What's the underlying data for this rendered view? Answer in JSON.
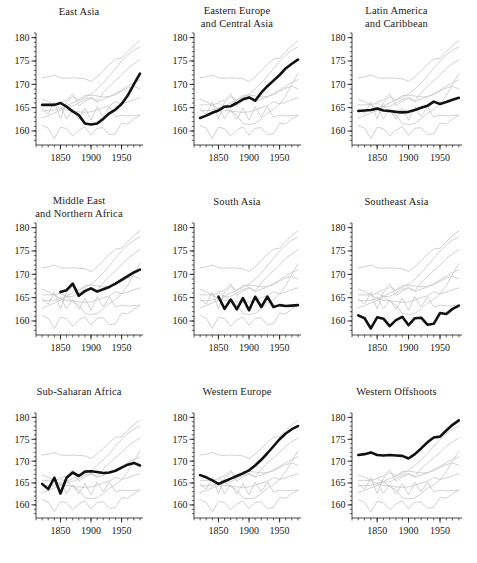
{
  "figure": {
    "type": "small-multiples-line-grid",
    "rows": 3,
    "cols": 3,
    "width": 477,
    "height": 563,
    "background": "#ffffff",
    "highlight_color": "#111111",
    "context_color": "#c9c9c9"
  },
  "chart_data": {
    "type": "line",
    "title": "",
    "subtitle": "",
    "xlabel": "",
    "ylabel": "",
    "xlim": [
      1810,
      1985
    ],
    "ylim": [
      157,
      181
    ],
    "grid": false,
    "legend": "none",
    "x_ticks_major": [
      1850,
      1900,
      1950
    ],
    "x_tick_labels": [
      "1850",
      "1900",
      "1950"
    ],
    "x_ticks_minor_step": 10,
    "y_ticks_major": [
      160,
      165,
      170,
      175,
      180
    ],
    "y_tick_labels": [
      "160",
      "165",
      "170",
      "175",
      "180"
    ],
    "y_ticks_minor_step": 1,
    "x": [
      1820,
      1830,
      1840,
      1850,
      1860,
      1870,
      1880,
      1890,
      1900,
      1910,
      1920,
      1930,
      1940,
      1950,
      1960,
      1970,
      1980
    ],
    "series": [
      {
        "name": "East Asia",
        "panel": 0,
        "values": [
          165.6,
          165.6,
          165.6,
          166.0,
          165.2,
          164.2,
          163.4,
          161.6,
          161.4,
          161.6,
          162.6,
          163.8,
          164.6,
          165.8,
          167.6,
          170.0,
          172.3
        ]
      },
      {
        "name": "Eastern Europe and Central Asia",
        "panel": 1,
        "values": [
          162.8,
          163.3,
          163.9,
          164.4,
          165.2,
          165.3,
          166.0,
          166.8,
          167.2,
          166.5,
          168.2,
          169.6,
          170.8,
          172.0,
          173.4,
          174.4,
          175.3
        ]
      },
      {
        "name": "Latin America and Caribbean",
        "panel": 2,
        "values": [
          164.3,
          164.4,
          164.5,
          164.8,
          164.4,
          164.3,
          164.1,
          164.0,
          164.1,
          164.5,
          165.0,
          165.4,
          166.3,
          165.8,
          166.2,
          166.7,
          167.1
        ]
      },
      {
        "name": "Middle East and Northern Africa",
        "panel": 3,
        "values": [
          null,
          null,
          null,
          166.2,
          166.6,
          168.0,
          165.4,
          166.4,
          167.0,
          166.3,
          166.8,
          167.3,
          168.0,
          168.8,
          169.6,
          170.4,
          171.0
        ]
      },
      {
        "name": "South Asia",
        "panel": 4,
        "values": [
          null,
          null,
          null,
          165.2,
          162.6,
          164.6,
          162.5,
          164.9,
          162.3,
          165.2,
          163.0,
          165.2,
          163.0,
          163.4,
          163.2,
          163.3,
          163.4
        ]
      },
      {
        "name": "Southeast Asia",
        "panel": 5,
        "values": [
          161.2,
          160.6,
          158.4,
          160.8,
          160.5,
          158.9,
          160.2,
          160.9,
          159.1,
          160.6,
          160.7,
          159.2,
          159.4,
          161.7,
          161.5,
          162.6,
          163.3
        ]
      },
      {
        "name": "Sub-Saharan Africa",
        "panel": 6,
        "values": [
          164.8,
          163.6,
          166.2,
          162.6,
          166.2,
          167.4,
          166.6,
          167.6,
          167.7,
          167.5,
          167.3,
          167.4,
          167.8,
          168.5,
          169.2,
          169.6,
          169.0
        ]
      },
      {
        "name": "Western Europe",
        "panel": 7,
        "values": [
          166.8,
          166.3,
          165.6,
          164.8,
          165.4,
          166.0,
          166.6,
          167.2,
          167.9,
          169.0,
          170.3,
          171.8,
          173.4,
          175.0,
          176.3,
          177.3,
          178.0
        ]
      },
      {
        "name": "Western Offshoots",
        "panel": 8,
        "values": [
          171.4,
          171.6,
          172.0,
          171.4,
          171.3,
          171.4,
          171.3,
          171.2,
          170.6,
          171.6,
          172.9,
          174.3,
          175.4,
          175.6,
          177.0,
          178.3,
          179.3
        ]
      }
    ]
  },
  "panels": [
    {
      "id": "east-asia",
      "title": "East Asia",
      "title_lines": [
        "East Asia"
      ]
    },
    {
      "id": "eastern-europe-central-asia",
      "title": "Eastern Europe and Central Asia",
      "title_lines": [
        "Eastern Europe",
        "and Central Asia"
      ]
    },
    {
      "id": "latin-america-caribbean",
      "title": "Latin America and Caribbean",
      "title_lines": [
        "Latin America",
        "and Caribbean"
      ]
    },
    {
      "id": "middle-east-northern-africa",
      "title": "Middle East and Northern Africa",
      "title_lines": [
        "Middle East",
        "and Northern Africa"
      ]
    },
    {
      "id": "south-asia",
      "title": "South Asia",
      "title_lines": [
        "South Asia"
      ]
    },
    {
      "id": "southeast-asia",
      "title": "Southeast Asia",
      "title_lines": [
        "Southeast Asia"
      ]
    },
    {
      "id": "sub-saharan-africa",
      "title": "Sub-Saharan Africa",
      "title_lines": [
        "Sub-Saharan Africa"
      ]
    },
    {
      "id": "western-europe",
      "title": "Western Europe",
      "title_lines": [
        "Western Europe"
      ]
    },
    {
      "id": "western-offshoots",
      "title": "Western Offshoots",
      "title_lines": [
        "Western Offshoots"
      ]
    }
  ],
  "axes": {
    "y_tick_labels": [
      "180",
      "175",
      "170",
      "165",
      "160"
    ],
    "x_tick_labels": [
      "1850",
      "1900",
      "1950"
    ]
  }
}
